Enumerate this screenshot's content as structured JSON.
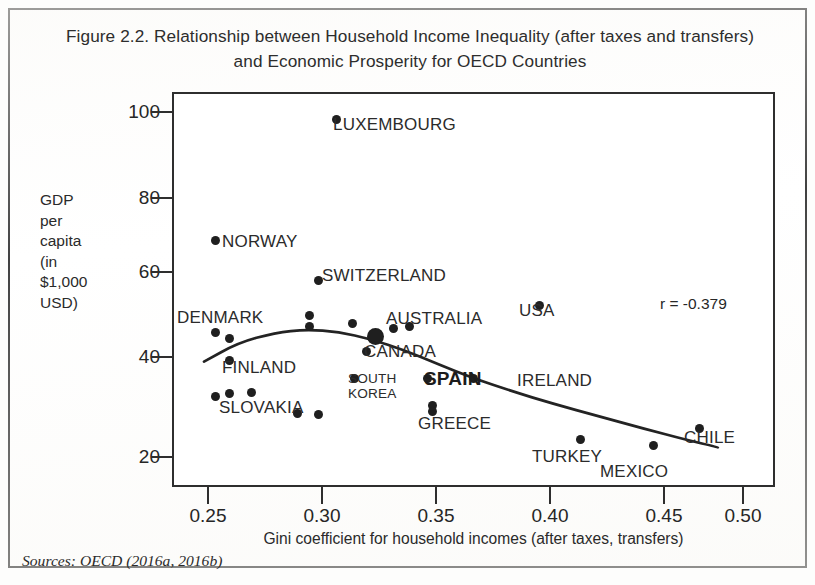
{
  "figure": {
    "title_line1": "Figure 2.2.  Relationship between Household Income Inequality (after taxes and transfers)",
    "title_line2": "and Economic Prosperity for OECD Countries",
    "source_note": "Sources: OECD (2016a, 2016b)",
    "annotation_r": "r = -0.379"
  },
  "chart_data": {
    "type": "scatter",
    "title": "Figure 2.2. Relationship between Household Income Inequality (after taxes and transfers) and Economic Prosperity for OECD Countries",
    "xlabel": "Gini coefficient for household incomes (after taxes, transfers)",
    "ylabel": "GDP per capita (in $1,000 USD)",
    "ylabel_lines": [
      "GDP",
      "per",
      "capita",
      "(in",
      "$1,000",
      "USD)"
    ],
    "xlim": [
      0.233,
      0.497
    ],
    "ylim": [
      8.5,
      103
    ],
    "xticks": [
      0.25,
      0.3,
      0.35,
      0.4,
      0.45,
      0.5
    ],
    "xtick_labels": [
      "0.25",
      "0.30",
      "0.35",
      "0.40",
      "0.45",
      "0.50"
    ],
    "yticks": [
      20,
      40,
      60,
      80,
      100
    ],
    "ytick_labels": [
      "20",
      "40",
      "60",
      "80",
      "100"
    ],
    "grid": false,
    "legend": false,
    "correlation": -0.379,
    "trendline": {
      "type": "quadratic-fit",
      "description": "downward-curving fitted line from low Gini to high Gini",
      "points": [
        [
          0.247,
          38.5
        ],
        [
          0.262,
          43.0
        ],
        [
          0.278,
          45.4
        ],
        [
          0.292,
          46.2
        ],
        [
          0.306,
          45.6
        ],
        [
          0.32,
          43.9
        ],
        [
          0.335,
          41.2
        ],
        [
          0.35,
          37.8
        ],
        [
          0.365,
          34.5
        ],
        [
          0.382,
          31.4
        ],
        [
          0.4,
          28.4
        ],
        [
          0.42,
          25.4
        ],
        [
          0.44,
          22.4
        ],
        [
          0.458,
          19.8
        ],
        [
          0.472,
          18.0
        ]
      ]
    },
    "points": [
      {
        "label": "LUXEMBOURG",
        "x": 0.305,
        "y": 96.5,
        "label_pos": "right",
        "size": "normal"
      },
      {
        "label": "NORWAY",
        "x": 0.252,
        "y": 67.5,
        "label_pos": "right",
        "size": "normal"
      },
      {
        "label": "SWITZERLAND",
        "x": 0.297,
        "y": 58.0,
        "label_pos": "right",
        "size": "normal"
      },
      {
        "label": "USA",
        "x": 0.394,
        "y": 52.0,
        "label_pos": "right",
        "size": "normal"
      },
      {
        "label": "AUSTRALIA",
        "x": 0.337,
        "y": 47.0,
        "label_pos": "right",
        "size": "normal"
      },
      {
        "label": "CANADA",
        "x": 0.322,
        "y": 44.5,
        "label_pos": "right",
        "size": "large"
      },
      {
        "label": "DENMARK",
        "x": 0.252,
        "y": 45.5,
        "label_pos": "above",
        "size": "normal"
      },
      {
        "label": "FINLAND",
        "x": 0.258,
        "y": 38.8,
        "label_pos": "right",
        "size": "normal"
      },
      {
        "label": "SLOVAKIA",
        "x": 0.252,
        "y": 30.2,
        "label_pos": "right",
        "size": "normal"
      },
      {
        "label": "SOUTH KOREA",
        "x": 0.313,
        "y": 34.5,
        "label_pos": "right",
        "size": "normal"
      },
      {
        "label": "SPAIN",
        "x": 0.345,
        "y": 34.5,
        "label_pos": "right",
        "size": "normal"
      },
      {
        "label": "IRELAND",
        "x": 0.365,
        "y": 34.4,
        "label_pos": "right",
        "size": "normal"
      },
      {
        "label": "GREECE",
        "x": 0.347,
        "y": 28.0,
        "label_pos": "right",
        "size": "normal"
      },
      {
        "label": "TURKEY",
        "x": 0.412,
        "y": 19.8,
        "label_pos": "right",
        "size": "normal"
      },
      {
        "label": "MEXICO",
        "x": 0.444,
        "y": 18.4,
        "label_pos": "right",
        "size": "normal"
      },
      {
        "label": "CHILE",
        "x": 0.464,
        "y": 22.5,
        "label_pos": "right",
        "size": "normal"
      }
    ],
    "unlabeled_points": [
      {
        "x": 0.258,
        "y": 44.0
      },
      {
        "x": 0.293,
        "y": 49.5
      },
      {
        "x": 0.293,
        "y": 47.0
      },
      {
        "x": 0.312,
        "y": 47.5
      },
      {
        "x": 0.33,
        "y": 46.5
      },
      {
        "x": 0.318,
        "y": 40.8
      },
      {
        "x": 0.258,
        "y": 30.8
      },
      {
        "x": 0.268,
        "y": 31.0
      },
      {
        "x": 0.288,
        "y": 26.0
      },
      {
        "x": 0.297,
        "y": 25.8
      },
      {
        "x": 0.347,
        "y": 26.5
      }
    ]
  },
  "labels": {
    "luxembourg": "LUXEMBOURG",
    "norway": "NORWAY",
    "switzerland": "SWITZERLAND",
    "usa": "USA",
    "australia": "AUSTRALIA",
    "canada": "CANADA",
    "denmark": "DENMARK",
    "finland": "FINLAND",
    "slovakia": "SLOVAKIA",
    "south_korea_line1": "SOUTH",
    "south_korea_line2": "KOREA",
    "spain": "SPAIN",
    "ireland": "IRELAND",
    "greece": "GREECE",
    "turkey": "TURKEY",
    "mexico": "MEXICO",
    "chile": "CHILE"
  },
  "axes": {
    "y_title_lines": [
      "GDP",
      "per",
      "capita",
      "(in",
      "$1,000",
      "USD)"
    ],
    "x_title": "Gini coefficient for household incomes (after taxes, transfers)",
    "ytick_0": "20",
    "ytick_1": "40",
    "ytick_2": "60",
    "ytick_3": "80",
    "ytick_4": "100",
    "xtick_0": "0.25",
    "xtick_1": "0.30",
    "xtick_2": "0.35",
    "xtick_3": "0.40",
    "xtick_4": "0.45",
    "xtick_5": "0.50"
  }
}
